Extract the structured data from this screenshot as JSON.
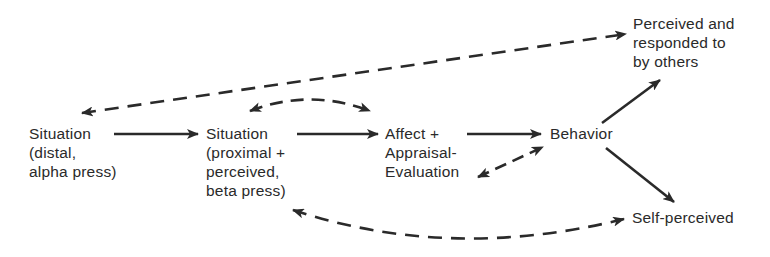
{
  "diagram": {
    "nodes": {
      "situation_distal": {
        "lines": [
          "Situation",
          "(distal,",
          "alpha press)"
        ]
      },
      "situation_proximal": {
        "lines": [
          "Situation",
          "(proximal +",
          "perceived,",
          "beta press)"
        ]
      },
      "affect_appraisal": {
        "lines": [
          "Affect +",
          "Appraisal-",
          "Evaluation"
        ]
      },
      "behavior": {
        "lines": [
          "Behavior"
        ]
      },
      "perceived_by_others": {
        "lines": [
          "Perceived and",
          "responded to",
          "by others"
        ]
      },
      "self_perceived": {
        "lines": [
          "Self-perceived"
        ]
      }
    },
    "edges": [
      {
        "from": "situation_distal",
        "to": "situation_proximal",
        "style": "solid",
        "direction": "forward"
      },
      {
        "from": "situation_proximal",
        "to": "affect_appraisal",
        "style": "solid",
        "direction": "forward"
      },
      {
        "from": "affect_appraisal",
        "to": "behavior",
        "style": "solid",
        "direction": "forward"
      },
      {
        "from": "behavior",
        "to": "perceived_by_others",
        "style": "solid",
        "direction": "forward"
      },
      {
        "from": "behavior",
        "to": "self_perceived",
        "style": "solid",
        "direction": "forward"
      },
      {
        "from": "situation_proximal",
        "to": "affect_appraisal",
        "style": "dashed",
        "direction": "both",
        "curve": "arc-above"
      },
      {
        "from": "affect_appraisal",
        "to": "behavior",
        "style": "dashed",
        "direction": "both"
      },
      {
        "from": "situation_distal",
        "to": "perceived_by_others",
        "style": "dashed",
        "direction": "both"
      },
      {
        "from": "situation_proximal",
        "to": "self_perceived",
        "style": "dashed",
        "direction": "both",
        "curve": "arc-below"
      }
    ],
    "colors": {
      "ink": "#2a2a2a",
      "background": "#ffffff"
    }
  }
}
